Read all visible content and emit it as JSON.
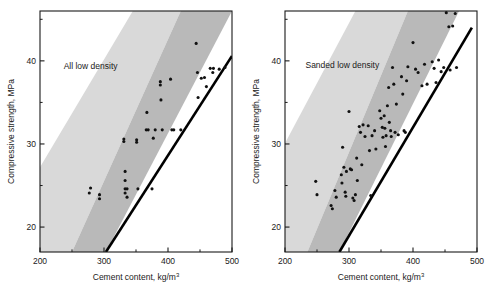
{
  "figure": {
    "background": "#ffffff",
    "point_color": "#111111",
    "band_light_color": "#d9d9d9",
    "band_dark_color": "#b9b9b9",
    "boundary_line_color": "#000000",
    "axis_color": "#1a1a1a"
  },
  "chart_data": [
    {
      "type": "scatter",
      "title": "All low density",
      "xlabel": "Cement content, kg/m",
      "xlabel_sup": "3",
      "ylabel": "Compressive strength, MPa",
      "xlim": [
        200,
        500
      ],
      "ylim": [
        17,
        46
      ],
      "xticks": [
        200,
        300,
        400,
        500
      ],
      "xticklabels": [
        "200",
        "300",
        "400",
        "500"
      ],
      "xminorticks": [
        250,
        350,
        450
      ],
      "yticks": [
        20,
        30,
        40
      ],
      "yticklabels": [
        "20",
        "30",
        "40"
      ],
      "yminorticks": [
        25,
        35,
        45
      ],
      "grid": false,
      "legend": "none",
      "annotations": [
        {
          "text": "All low density",
          "x": 237,
          "y": 39.0
        }
      ],
      "bands": [
        {
          "name": "light-upper-band",
          "color": "#d9d9d9",
          "points": [
            [
              200,
              27.2
            ],
            [
              345,
              46.0
            ],
            [
              420,
              46.0
            ],
            [
              250,
              17.0
            ],
            [
              200,
              17.0
            ]
          ]
        },
        {
          "name": "dark-lower-band",
          "color": "#b9b9b9",
          "points": [
            [
              250,
              17.0
            ],
            [
              420,
              46.0
            ],
            [
              500,
              46.0
            ],
            [
              303,
              17.0
            ]
          ]
        }
      ],
      "boundary_line": {
        "name": "lower-bound-line",
        "color": "#000000",
        "width": 2.6,
        "points": [
          [
            303,
            17.0
          ],
          [
            500,
            40.6
          ]
        ]
      },
      "points": [
        [
          279,
          24.7
        ],
        [
          277,
          24.1
        ],
        [
          293,
          23.9
        ],
        [
          293,
          23.4
        ],
        [
          331,
          30.6
        ],
        [
          331,
          30.3
        ],
        [
          333,
          26.7
        ],
        [
          333,
          25.6
        ],
        [
          333,
          24.6
        ],
        [
          333,
          24.1
        ],
        [
          336,
          24.6
        ],
        [
          336,
          23.6
        ],
        [
          351,
          30.5
        ],
        [
          351,
          30.2
        ],
        [
          353,
          24.6
        ],
        [
          366,
          31.7
        ],
        [
          367,
          33.8
        ],
        [
          369,
          31.7
        ],
        [
          375,
          24.6
        ],
        [
          377,
          30.7
        ],
        [
          380,
          31.7
        ],
        [
          388,
          37.5
        ],
        [
          388,
          37.1
        ],
        [
          389,
          35.3
        ],
        [
          391,
          31.7
        ],
        [
          404,
          37.8
        ],
        [
          406,
          31.7
        ],
        [
          409,
          31.7
        ],
        [
          420,
          31.7
        ],
        [
          444,
          42.1
        ],
        [
          446,
          38.6
        ],
        [
          447,
          35.6
        ],
        [
          452,
          37.9
        ],
        [
          457,
          38.0
        ],
        [
          460,
          36.9
        ],
        [
          466,
          39.1
        ],
        [
          470,
          38.6
        ],
        [
          471,
          39.1
        ],
        [
          480,
          39.0
        ],
        [
          489,
          39.2
        ]
      ]
    },
    {
      "type": "scatter",
      "title": "Sanded low density",
      "xlabel": "Cement content, kg/m",
      "xlabel_sup": "3",
      "ylabel": "Compressive strength, MPa",
      "xlim": [
        200,
        500
      ],
      "ylim": [
        17,
        46
      ],
      "xticks": [
        200,
        300,
        400,
        500
      ],
      "xticklabels": [
        "200",
        "300",
        "400",
        "500"
      ],
      "xminorticks": [
        250,
        350,
        450
      ],
      "yticks": [
        20,
        30,
        40
      ],
      "yticklabels": [
        "20",
        "30",
        "40"
      ],
      "yminorticks": [
        25,
        35,
        45
      ],
      "grid": false,
      "legend": "none",
      "annotations": [
        {
          "text": "Sanded low density",
          "x": 232,
          "y": 39.1
        }
      ],
      "bands": [
        {
          "name": "light-upper-band",
          "color": "#d9d9d9",
          "points": [
            [
              200,
              30.1
            ],
            [
              310,
              46.0
            ],
            [
              392,
              46.0
            ],
            [
              235,
              17.0
            ],
            [
              200,
              17.0
            ]
          ]
        },
        {
          "name": "dark-lower-band",
          "color": "#b9b9b9",
          "points": [
            [
              235,
              17.0
            ],
            [
              392,
              46.0
            ],
            [
              472,
              46.0
            ],
            [
              285,
              17.0
            ]
          ]
        }
      ],
      "boundary_line": {
        "name": "lower-bound-line",
        "color": "#000000",
        "width": 2.6,
        "points": [
          [
            285,
            17.0
          ],
          [
            492,
            44.0
          ]
        ]
      },
      "points": [
        [
          248,
          25.5
        ],
        [
          250,
          23.9
        ],
        [
          272,
          22.6
        ],
        [
          274,
          22.2
        ],
        [
          278,
          24.4
        ],
        [
          280,
          23.6
        ],
        [
          288,
          26.3
        ],
        [
          289,
          25.3
        ],
        [
          290,
          29.6
        ],
        [
          292,
          27.2
        ],
        [
          294,
          24.2
        ],
        [
          295,
          23.7
        ],
        [
          296,
          26.7
        ],
        [
          300,
          33.9
        ],
        [
          302,
          27.0
        ],
        [
          304,
          26.9
        ],
        [
          306,
          23.5
        ],
        [
          308,
          23.2
        ],
        [
          310,
          23.9
        ],
        [
          312,
          28.3
        ],
        [
          313,
          25.6
        ],
        [
          316,
          32.1
        ],
        [
          318,
          31.4
        ],
        [
          320,
          27.5
        ],
        [
          322,
          32.3
        ],
        [
          325,
          30.9
        ],
        [
          330,
          32.2
        ],
        [
          332,
          29.2
        ],
        [
          334,
          23.8
        ],
        [
          336,
          31.0
        ],
        [
          340,
          31.6
        ],
        [
          342,
          29.4
        ],
        [
          348,
          34.0
        ],
        [
          350,
          33.1
        ],
        [
          352,
          32.0
        ],
        [
          353,
          30.8
        ],
        [
          355,
          33.4
        ],
        [
          356,
          31.9
        ],
        [
          357,
          29.7
        ],
        [
          358,
          31.0
        ],
        [
          360,
          34.6
        ],
        [
          362,
          36.8
        ],
        [
          363,
          32.6
        ],
        [
          365,
          31.6
        ],
        [
          366,
          30.9
        ],
        [
          368,
          39.2
        ],
        [
          370,
          37.2
        ],
        [
          372,
          31.4
        ],
        [
          374,
          34.8
        ],
        [
          377,
          31.1
        ],
        [
          382,
          38.1
        ],
        [
          384,
          36.0
        ],
        [
          386,
          31.6
        ],
        [
          388,
          31.4
        ],
        [
          390,
          37.6
        ],
        [
          392,
          39.3
        ],
        [
          400,
          42.2
        ],
        [
          404,
          39.0
        ],
        [
          408,
          38.6
        ],
        [
          414,
          37.0
        ],
        [
          418,
          39.6
        ],
        [
          422,
          37.2
        ],
        [
          430,
          39.9
        ],
        [
          433,
          39.1
        ],
        [
          436,
          37.4
        ],
        [
          440,
          40.1
        ],
        [
          444,
          38.7
        ],
        [
          448,
          39.2
        ],
        [
          452,
          45.8
        ],
        [
          456,
          44.1
        ],
        [
          458,
          38.9
        ],
        [
          462,
          44.2
        ],
        [
          466,
          45.7
        ],
        [
          468,
          39.2
        ]
      ]
    }
  ]
}
